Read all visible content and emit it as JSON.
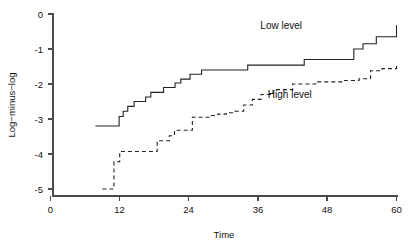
{
  "chart_data": {
    "type": "line",
    "title": "",
    "subtitle": "",
    "xlabel": "Time",
    "ylabel": "Log−minus−log",
    "xlim": [
      0,
      60
    ],
    "ylim": [
      -5,
      0
    ],
    "xticks": [
      0,
      12,
      24,
      36,
      48,
      60
    ],
    "xticklabels": [
      "0",
      "12",
      "24",
      "36",
      "48",
      "60"
    ],
    "yticks": [
      0,
      -1,
      -2,
      -3,
      -4,
      -5
    ],
    "yticklabels": [
      "0",
      "-1",
      "-2",
      "-3",
      "-4",
      "-5"
    ],
    "grid": false,
    "legend_position": "inline-annotation",
    "drawstyle": "steps-post",
    "series": [
      {
        "name": "Low level",
        "linestyle": "solid",
        "color": "#222222",
        "label_x": 40.0,
        "label_y": -0.42,
        "x": [
          7.8,
          9.5,
          11.2,
          11.9,
          12.6,
          13.4,
          14.5,
          15.6,
          16.5,
          17.4,
          18.5,
          19.6,
          20.6,
          21.6,
          22.6,
          23.4,
          24.2,
          25.2,
          26.2,
          27.6,
          33.0,
          34.2,
          40.2,
          44.0,
          51.0,
          52.6,
          54.2,
          56.5,
          60.0
        ],
        "y": [
          -3.2,
          -3.2,
          -3.2,
          -2.93,
          -2.78,
          -2.64,
          -2.5,
          -2.5,
          -2.37,
          -2.24,
          -2.24,
          -2.1,
          -2.1,
          -1.97,
          -1.86,
          -1.86,
          -1.72,
          -1.72,
          -1.6,
          -1.6,
          -1.6,
          -1.46,
          -1.46,
          -1.3,
          -1.3,
          -1.0,
          -0.85,
          -0.65,
          -0.32
        ]
      },
      {
        "name": "High level",
        "linestyle": "dashed",
        "color": "#222222",
        "label_x": 41.5,
        "label_y": -2.4,
        "x": [
          9.0,
          10.4,
          11.0,
          12.0,
          13.2,
          15.0,
          16.6,
          18.5,
          20.6,
          21.5,
          22.6,
          23.6,
          24.6,
          26.0,
          27.5,
          29.0,
          30.5,
          32.0,
          33.5,
          35.0,
          36.5,
          38.6,
          42.0,
          46.0,
          50.5,
          53.5,
          55.5,
          57.5,
          60.0
        ],
        "y": [
          -5.0,
          -5.0,
          -4.22,
          -3.93,
          -3.93,
          -3.93,
          -3.93,
          -3.62,
          -3.48,
          -3.32,
          -3.32,
          -3.32,
          -2.95,
          -2.95,
          -2.9,
          -2.86,
          -2.82,
          -2.78,
          -2.6,
          -2.44,
          -2.3,
          -2.16,
          -2.0,
          -1.94,
          -1.9,
          -1.85,
          -1.62,
          -1.56,
          -1.48
        ]
      }
    ]
  },
  "axes": {
    "x_axis_name": "Time",
    "y_axis_name": "Log−minus−log"
  }
}
